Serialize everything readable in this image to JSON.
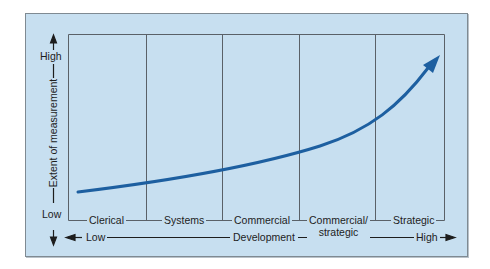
{
  "diagram": {
    "y_axis": {
      "title": "Extent of measurement",
      "high_label": "High",
      "low_label": "Low"
    },
    "x_axis": {
      "title": "Development",
      "low_label": "Low",
      "high_label": "High"
    },
    "stages": [
      {
        "label": "Clerical"
      },
      {
        "label": "Systems"
      },
      {
        "label": "Commercial"
      },
      {
        "label": "Commercial/",
        "label2": "strategic"
      },
      {
        "label": "Strategic"
      }
    ],
    "curve": {
      "description": "Exponentially rising arrow from low-left to high-right",
      "color": "#1d5fa0"
    },
    "colors": {
      "background": "#c7dff0",
      "lines": "#5a6168",
      "curve": "#1d5fa0"
    }
  }
}
